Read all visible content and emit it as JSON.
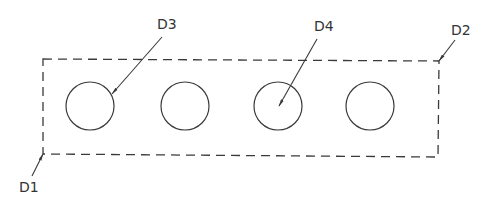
{
  "diagram": {
    "colors": {
      "line": "#3a3a3a",
      "text": "#333333",
      "background": "#ffffff"
    },
    "boundary": {
      "style": "dashed",
      "corners": {
        "top_left": [
          43,
          59
        ],
        "top_right": [
          439,
          61
        ],
        "bottom_right": [
          438,
          157
        ],
        "bottom_left": [
          43,
          154
        ]
      }
    },
    "circles": [
      {
        "id": "circle-1",
        "cx": 90,
        "cy": 106,
        "r": 24
      },
      {
        "id": "circle-2",
        "cx": 185,
        "cy": 106,
        "r": 24
      },
      {
        "id": "circle-3",
        "cx": 278,
        "cy": 106,
        "r": 24
      },
      {
        "id": "circle-4",
        "cx": 370,
        "cy": 106,
        "r": 24
      }
    ],
    "callouts": [
      {
        "label": "D1",
        "text_pos": [
          19,
          192
        ],
        "leader_from": [
          32,
          176
        ],
        "leader_to": [
          43,
          154
        ]
      },
      {
        "label": "D2",
        "text_pos": [
          451,
          35
        ],
        "leader_from": [
          455,
          40
        ],
        "leader_to": [
          439,
          61
        ]
      },
      {
        "label": "D3",
        "text_pos": [
          157,
          29
        ],
        "leader_from": [
          162,
          37
        ],
        "leader_to": [
          112,
          94
        ]
      },
      {
        "label": "D4",
        "text_pos": [
          314,
          31
        ],
        "leader_from": [
          317,
          39
        ],
        "leader_to": [
          279,
          106
        ]
      }
    ]
  }
}
